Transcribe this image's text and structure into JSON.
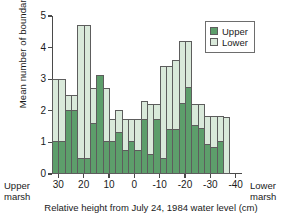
{
  "chart_data": {
    "type": "bar",
    "title": "",
    "xlabel": "Relative height from July 24, 1984 water level (cm)",
    "ylabel": "Mean number of boundaries",
    "xlim": [
      32.5,
      -42.5
    ],
    "ylim": [
      0,
      5
    ],
    "x_ticks": [
      30,
      20,
      10,
      0,
      -10,
      -20,
      -30,
      -40
    ],
    "x_tick_labels": [
      "30",
      "20",
      "10",
      "0",
      "-10",
      "-20",
      "-30",
      "-40"
    ],
    "y_ticks": [
      0,
      1,
      2,
      3,
      4,
      5
    ],
    "y_tick_labels": [
      "0",
      "1",
      "2",
      "3",
      "4",
      "5"
    ],
    "grid": false,
    "overlay_mode": "overlaid",
    "bin_width": 2.5,
    "bin_centers": [
      31.25,
      28.75,
      26.25,
      23.75,
      21.25,
      18.75,
      16.25,
      13.75,
      11.25,
      8.75,
      6.25,
      3.75,
      1.25,
      -1.25,
      -3.75,
      -6.25,
      -8.75,
      -11.25,
      -13.75,
      -16.25,
      -18.75,
      -21.25,
      -23.75,
      -26.25,
      -28.75,
      -31.25,
      -33.75,
      -36.25
    ],
    "series": [
      {
        "name": "Upper",
        "color": "#5d9e6b",
        "values": [
          1.05,
          1.05,
          2.03,
          2.03,
          0.52,
          0.52,
          1.62,
          3.13,
          1.05,
          1.05,
          1.32,
          0.75,
          1.05,
          0.75,
          1.75,
          0.62,
          1.73,
          0.52,
          1.43,
          1.43,
          2.25,
          2.75,
          1.55,
          1.45,
          0.95,
          0.85,
          1.05,
          0
        ]
      },
      {
        "name": "Lower",
        "color": "#d9e9da",
        "values": [
          3.0,
          3.0,
          2.5,
          2.5,
          4.7,
          4.7,
          2.73,
          3.13,
          2.73,
          1.75,
          2.02,
          1.73,
          1.73,
          1.73,
          2.3,
          2.2,
          2.2,
          3.42,
          3.42,
          3.62,
          4.22,
          4.22,
          2.2,
          2.2,
          1.85,
          1.85,
          1.85,
          1.82
        ]
      }
    ],
    "legend": {
      "position": "top-right",
      "entries": [
        {
          "label": "Upper",
          "color": "#5d9e6b"
        },
        {
          "label": "Lower",
          "color": "#d9e9da"
        }
      ]
    },
    "annotations": {
      "left_corner": "Upper\nmarsh",
      "left_corner_line1": "Upper",
      "left_corner_line2": "marsh",
      "right_corner_line1": "Lower",
      "right_corner_line2": "marsh"
    }
  }
}
